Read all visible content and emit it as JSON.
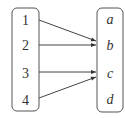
{
  "diagram": {
    "type": "function-mapping",
    "domain_set": [
      "1",
      "2",
      "3",
      "4"
    ],
    "codomain_set": [
      "a",
      "b",
      "c",
      "d"
    ],
    "mappings": [
      {
        "from": "1",
        "to": "b"
      },
      {
        "from": "2",
        "to": "b"
      },
      {
        "from": "3",
        "to": "c"
      },
      {
        "from": "4",
        "to": "c"
      }
    ],
    "colors": {
      "stroke": "#444444",
      "text": "#333333",
      "background": "#ffffff"
    }
  }
}
